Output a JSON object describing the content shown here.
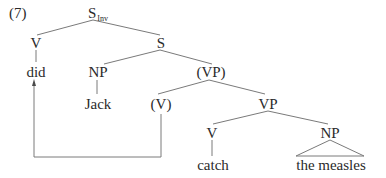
{
  "example": {
    "number": "(7)"
  },
  "tree": {
    "root": {
      "label": "S",
      "subscript": "Inv"
    },
    "nodes": {
      "v_top": "V",
      "s": "S",
      "did": "did",
      "np_subj": "NP",
      "vp_trace": "(VP)",
      "jack": "Jack",
      "v_trace": "(V)",
      "vp": "VP",
      "v_low": "V",
      "np_obj": "NP",
      "catch": "catch",
      "the_measles": "the measles"
    },
    "movement_arrow": {
      "from": "(V)",
      "to": "did"
    }
  }
}
